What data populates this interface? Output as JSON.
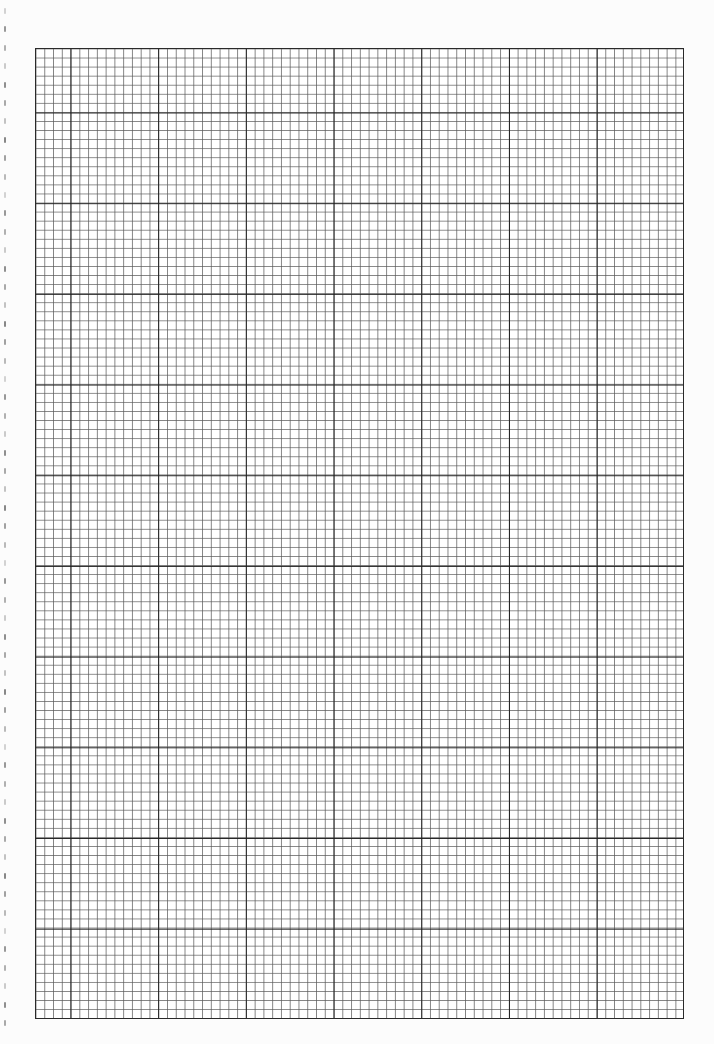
{
  "sheet": {
    "type": "graph-paper",
    "columns": 74,
    "rows": 107,
    "major_every": 10,
    "minor_line_color": "#5a5a5a",
    "major_line_color": "#1e1e1e",
    "background_color": "#ffffff"
  },
  "margin_marks": {
    "count": 56,
    "spacing_px": 18.4,
    "start_y": 8
  }
}
